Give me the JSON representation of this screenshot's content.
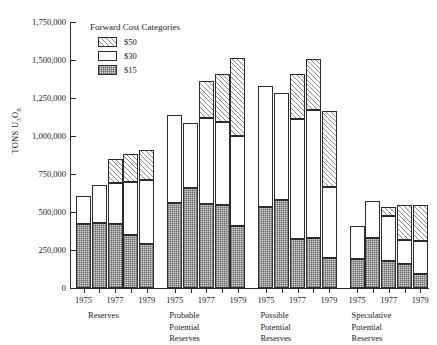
{
  "chart_data": {
    "type": "bar",
    "subtype": "stacked-bar-grouped",
    "title": "",
    "subtitle": "",
    "xlabel": "",
    "ylabel": "TONS U3O8",
    "ylabel_html": "TONS U<sub>3</sub>O<sub>8</sub>",
    "ylim": [
      0,
      1750000
    ],
    "ytick_interval": 250000,
    "ytick_labels": [
      "1,750,000",
      "1,500,000",
      "1,250,000",
      "1,000,000",
      "750,000",
      "500,000",
      "250,000",
      "0"
    ],
    "ytick_values": [
      1750000,
      1500000,
      1250000,
      1000000,
      750000,
      500000,
      250000,
      0
    ],
    "grid": false,
    "legend": {
      "title": "Forward Cost Categories",
      "position": "top-left-inside",
      "entries": [
        {
          "label": "$50",
          "pattern": "diagonal-hatch",
          "color": "#ffffff"
        },
        {
          "label": "$30",
          "pattern": "solid-white",
          "color": "#ffffff"
        },
        {
          "label": "$15",
          "pattern": "stipple-dots",
          "color": "#d9d9d9"
        }
      ]
    },
    "series": [
      {
        "name": "$15",
        "pattern": "stipple-dots"
      },
      {
        "name": "$30",
        "pattern": "solid-white"
      },
      {
        "name": "$50",
        "pattern": "diagonal-hatch"
      }
    ],
    "groups": [
      {
        "name": "Reserves",
        "name_lines": [
          "Reserves"
        ],
        "tick_labels": [
          "1975",
          "1977",
          "1979"
        ],
        "tick_label_positions": [
          0,
          2,
          4
        ],
        "bars": [
          {
            "year": "1975",
            "s15": 420000,
            "s30": 185000,
            "s50": 0,
            "total": 605000
          },
          {
            "year": "1976",
            "s15": 430000,
            "s30": 250000,
            "s50": 0,
            "total": 680000
          },
          {
            "year": "1977",
            "s15": 420000,
            "s30": 270000,
            "s50": 160000,
            "total": 850000
          },
          {
            "year": "1978",
            "s15": 350000,
            "s30": 350000,
            "s50": 185000,
            "total": 885000
          },
          {
            "year": "1979",
            "s15": 290000,
            "s30": 420000,
            "s50": 195000,
            "total": 905000
          }
        ]
      },
      {
        "name": "Probable Potential Reserves",
        "name_lines": [
          "Probable",
          "Potential",
          "Reserves"
        ],
        "tick_labels": [
          "1975",
          "1977",
          "1979"
        ],
        "tick_label_positions": [
          0,
          2,
          4
        ],
        "bars": [
          {
            "year": "1975",
            "s15": 560000,
            "s30": 580000,
            "s50": 0,
            "total": 1140000
          },
          {
            "year": "1976",
            "s15": 660000,
            "s30": 425000,
            "s50": 0,
            "total": 1085000
          },
          {
            "year": "1977",
            "s15": 555000,
            "s30": 565000,
            "s50": 240000,
            "total": 1360000
          },
          {
            "year": "1978",
            "s15": 545000,
            "s30": 550000,
            "s50": 310000,
            "total": 1405000
          },
          {
            "year": "1979",
            "s15": 410000,
            "s30": 590000,
            "s50": 510000,
            "total": 1510000
          }
        ]
      },
      {
        "name": "Possible Potential Reserves",
        "name_lines": [
          "Possible",
          "Potential",
          "Reserves"
        ],
        "tick_labels": [
          "1975",
          "1977",
          "1979"
        ],
        "tick_label_positions": [
          0,
          2,
          4
        ],
        "bars": [
          {
            "year": "1975",
            "s15": 530000,
            "s30": 800000,
            "s50": 0,
            "total": 1330000
          },
          {
            "year": "1976",
            "s15": 580000,
            "s30": 705000,
            "s50": 0,
            "total": 1285000
          },
          {
            "year": "1977",
            "s15": 320000,
            "s30": 790000,
            "s50": 300000,
            "total": 1410000
          },
          {
            "year": "1978",
            "s15": 330000,
            "s30": 840000,
            "s50": 335000,
            "total": 1505000
          },
          {
            "year": "1979",
            "s15": 200000,
            "s30": 465000,
            "s50": 500000,
            "total": 1165000
          }
        ]
      },
      {
        "name": "Speculative Potential Reserves",
        "name_lines": [
          "Speculative",
          "Potential",
          "Reserves"
        ],
        "tick_labels": [
          "1975",
          "1977",
          "1979"
        ],
        "tick_label_positions": [
          0,
          2,
          4
        ],
        "bars": [
          {
            "year": "1975",
            "s15": 190000,
            "s30": 215000,
            "s50": 0,
            "total": 405000
          },
          {
            "year": "1976",
            "s15": 330000,
            "s30": 245000,
            "s50": 0,
            "total": 575000
          },
          {
            "year": "1977",
            "s15": 175000,
            "s30": 300000,
            "s50": 55000,
            "total": 530000
          },
          {
            "year": "1978",
            "s15": 155000,
            "s30": 160000,
            "s50": 230000,
            "total": 545000
          },
          {
            "year": "1979",
            "s15": 90000,
            "s30": 220000,
            "s50": 235000,
            "total": 545000
          }
        ]
      }
    ]
  }
}
